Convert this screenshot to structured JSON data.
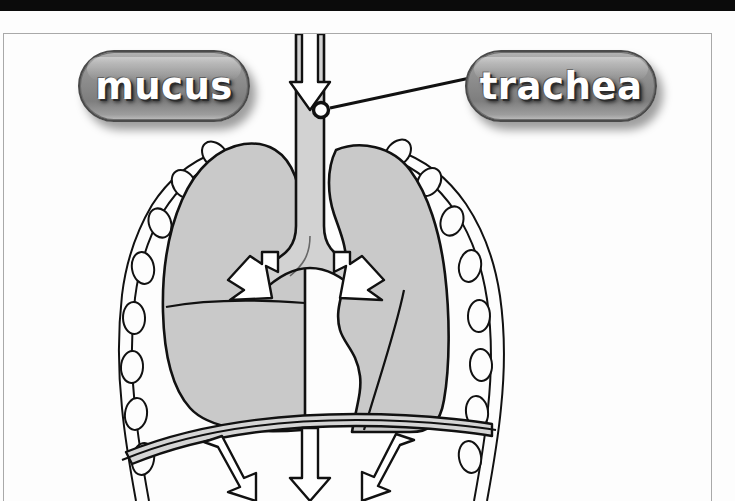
{
  "figure": {
    "background_color": "#fdfdfd",
    "panel_border_color": "#a9a9a9",
    "top_bar_color": "#0b0b0b"
  },
  "callouts": [
    {
      "id": "mucus",
      "label": "mucus",
      "shape": "rounded-pill",
      "fill_color": "#8b8b8b",
      "text_color": "#ffffff",
      "has_leader_line": false
    },
    {
      "id": "trachea",
      "label": "trachea",
      "shape": "rounded-pill",
      "fill_color": "#8b8b8b",
      "text_color": "#ffffff",
      "has_leader_line": true,
      "leader_line": {
        "from_x": 465,
        "from_y": 78,
        "to_x": 321,
        "to_y": 110,
        "endpoint_marker": "open-circle",
        "color": "#111111"
      }
    }
  ],
  "anatomy": {
    "lung_fill_color": "#c9c9c9",
    "outline_color": "#111111",
    "arrow_fill_color": "#ffffff",
    "rib_fill_color": "#fcfcfc",
    "diaphragm_fill_color": "#d5d5d5",
    "parts": [
      {
        "name": "trachea",
        "description": "vertical airway tube at center"
      },
      {
        "name": "left-lung",
        "description": "viewer-left lung with horizontal fissure"
      },
      {
        "name": "right-lung",
        "description": "viewer-right lung with cardiac notch and oblique fissure"
      },
      {
        "name": "bronchi",
        "description": "branching airways into each lung"
      },
      {
        "name": "rib-cage",
        "description": "chain of oval rib segments along both sides"
      },
      {
        "name": "diaphragm",
        "description": "curved muscular band below the lungs"
      }
    ],
    "airflow_arrows": [
      {
        "name": "inhalation-arrow-trachea",
        "direction": "down",
        "location": "inside trachea"
      },
      {
        "name": "bronchus-arrow-left",
        "direction": "down-left",
        "location": "left bronchus"
      },
      {
        "name": "bronchus-arrow-right",
        "direction": "down-right",
        "location": "right bronchus"
      },
      {
        "name": "diaphragm-arrow-left",
        "direction": "down",
        "location": "below diaphragm left"
      },
      {
        "name": "diaphragm-arrow-center",
        "direction": "down",
        "location": "below diaphragm center"
      },
      {
        "name": "diaphragm-arrow-right",
        "direction": "down",
        "location": "below diaphragm right"
      }
    ]
  }
}
